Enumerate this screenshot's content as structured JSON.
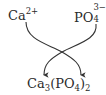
{
  "diagram": {
    "type": "ion-combination",
    "reactants": [
      {
        "id": "cation",
        "symbol": "Ca",
        "charge": "2+"
      },
      {
        "id": "anion",
        "symbol": "PO",
        "subscript": "4",
        "charge": "3−"
      }
    ],
    "product": {
      "formula_parts": [
        {
          "text": "Ca",
          "sub": "3"
        },
        {
          "text": "(PO",
          "sub": "4"
        },
        {
          "text": ")",
          "sub": "2"
        }
      ]
    },
    "arrows": [
      {
        "from": "Ca2+",
        "to": "product-right",
        "style": "curved-crossing"
      },
      {
        "from": "PO4 3-",
        "to": "product-left",
        "style": "curved-crossing"
      }
    ],
    "colors": {
      "text": "#2a2a2a",
      "arrow": "#333333",
      "background": "#ffffff"
    }
  }
}
